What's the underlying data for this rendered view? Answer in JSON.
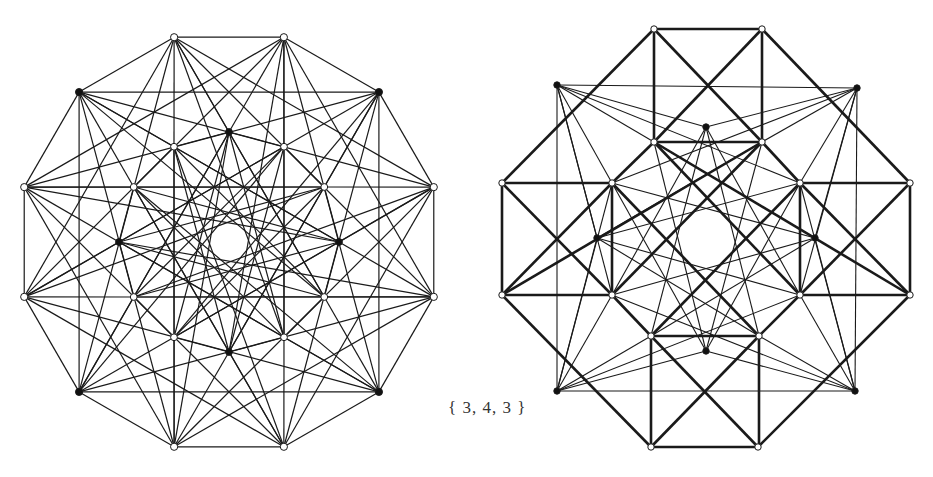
{
  "caption": "{ 3, 4, 3 }",
  "top_clipped_text": "",
  "colors": {
    "line": "#1a1a1a",
    "vertex_fill_white": "#ffffff",
    "vertex_fill_black": "#111111",
    "background": "#ffffff"
  },
  "left_figure": {
    "name": "24-cell projection (dodecagonal)",
    "center": [
      229,
      242
    ],
    "outer_radius": 212,
    "inner_radius": 110,
    "outer_ring": {
      "count": 12,
      "start_angle_deg": 15,
      "black_indices": [
        1,
        4,
        7,
        10
      ]
    },
    "inner_ring": {
      "count": 12,
      "start_angle_deg": 0,
      "black_indices": [
        0,
        3,
        6,
        9
      ]
    },
    "center_hole_radius": 28
  },
  "right_figure": {
    "name": "24-cell projection (octagonal squares)",
    "thick_edges": [
      [
        [
          654,
          29
        ],
        [
          762,
          29
        ]
      ],
      [
        [
          654,
          29
        ],
        [
          654,
          142
        ]
      ],
      [
        [
          762,
          29
        ],
        [
          762,
          142
        ]
      ],
      [
        [
          654,
          142
        ],
        [
          762,
          142
        ]
      ],
      [
        [
          654,
          29
        ],
        [
          762,
          142
        ]
      ],
      [
        [
          762,
          29
        ],
        [
          654,
          142
        ]
      ],
      [
        [
          502,
          183
        ],
        [
          612,
          183
        ]
      ],
      [
        [
          502,
          183
        ],
        [
          502,
          295
        ]
      ],
      [
        [
          612,
          183
        ],
        [
          612,
          295
        ]
      ],
      [
        [
          502,
          295
        ],
        [
          612,
          295
        ]
      ],
      [
        [
          502,
          183
        ],
        [
          612,
          295
        ]
      ],
      [
        [
          612,
          183
        ],
        [
          502,
          295
        ]
      ],
      [
        [
          800,
          183
        ],
        [
          910,
          183
        ]
      ],
      [
        [
          800,
          183
        ],
        [
          800,
          295
        ]
      ],
      [
        [
          910,
          183
        ],
        [
          910,
          295
        ]
      ],
      [
        [
          800,
          295
        ],
        [
          910,
          295
        ]
      ],
      [
        [
          800,
          183
        ],
        [
          910,
          295
        ]
      ],
      [
        [
          910,
          183
        ],
        [
          800,
          295
        ]
      ],
      [
        [
          651,
          336
        ],
        [
          759,
          336
        ]
      ],
      [
        [
          651,
          336
        ],
        [
          651,
          447
        ]
      ],
      [
        [
          759,
          336
        ],
        [
          759,
          447
        ]
      ],
      [
        [
          651,
          447
        ],
        [
          758,
          447
        ]
      ],
      [
        [
          651,
          336
        ],
        [
          758,
          447
        ]
      ],
      [
        [
          759,
          336
        ],
        [
          651,
          447
        ]
      ],
      [
        [
          654,
          29
        ],
        [
          502,
          183
        ]
      ],
      [
        [
          762,
          29
        ],
        [
          910,
          183
        ]
      ],
      [
        [
          502,
          295
        ],
        [
          651,
          447
        ]
      ],
      [
        [
          910,
          295
        ],
        [
          758,
          447
        ]
      ],
      [
        [
          654,
          142
        ],
        [
          612,
          183
        ]
      ],
      [
        [
          762,
          142
        ],
        [
          800,
          183
        ]
      ],
      [
        [
          612,
          295
        ],
        [
          651,
          336
        ]
      ],
      [
        [
          800,
          295
        ],
        [
          759,
          336
        ]
      ],
      [
        [
          654,
          142
        ],
        [
          910,
          295
        ]
      ],
      [
        [
          762,
          142
        ],
        [
          502,
          295
        ]
      ],
      [
        [
          612,
          183
        ],
        [
          759,
          336
        ]
      ],
      [
        [
          800,
          183
        ],
        [
          651,
          336
        ]
      ],
      [
        [
          654,
          142
        ],
        [
          800,
          295
        ]
      ],
      [
        [
          762,
          142
        ],
        [
          612,
          295
        ]
      ]
    ],
    "thin_edges": [
      [
        [
          557,
          85
        ],
        [
          857,
          88
        ]
      ],
      [
        [
          557,
          85
        ],
        [
          557,
          391
        ]
      ],
      [
        [
          857,
          88
        ],
        [
          855,
          391
        ]
      ],
      [
        [
          557,
          391
        ],
        [
          855,
          391
        ]
      ],
      [
        [
          557,
          85
        ],
        [
          706,
          127
        ]
      ],
      [
        [
          557,
          85
        ],
        [
          654,
          142
        ]
      ],
      [
        [
          557,
          85
        ],
        [
          612,
          183
        ]
      ],
      [
        [
          557,
          85
        ],
        [
          800,
          183
        ]
      ],
      [
        [
          557,
          85
        ],
        [
          612,
          295
        ]
      ],
      [
        [
          557,
          85
        ],
        [
          597,
          238
        ]
      ],
      [
        [
          857,
          88
        ],
        [
          706,
          127
        ]
      ],
      [
        [
          857,
          88
        ],
        [
          762,
          142
        ]
      ],
      [
        [
          857,
          88
        ],
        [
          800,
          183
        ]
      ],
      [
        [
          857,
          88
        ],
        [
          612,
          183
        ]
      ],
      [
        [
          857,
          88
        ],
        [
          800,
          295
        ]
      ],
      [
        [
          857,
          88
        ],
        [
          815,
          238
        ]
      ],
      [
        [
          557,
          391
        ],
        [
          706,
          351
        ]
      ],
      [
        [
          557,
          391
        ],
        [
          651,
          336
        ]
      ],
      [
        [
          557,
          391
        ],
        [
          612,
          295
        ]
      ],
      [
        [
          557,
          391
        ],
        [
          800,
          295
        ]
      ],
      [
        [
          557,
          391
        ],
        [
          612,
          183
        ]
      ],
      [
        [
          557,
          391
        ],
        [
          597,
          238
        ]
      ],
      [
        [
          855,
          391
        ],
        [
          706,
          351
        ]
      ],
      [
        [
          855,
          391
        ],
        [
          759,
          336
        ]
      ],
      [
        [
          855,
          391
        ],
        [
          800,
          295
        ]
      ],
      [
        [
          855,
          391
        ],
        [
          612,
          295
        ]
      ],
      [
        [
          855,
          391
        ],
        [
          800,
          183
        ]
      ],
      [
        [
          855,
          391
        ],
        [
          815,
          238
        ]
      ],
      [
        [
          706,
          127
        ],
        [
          612,
          295
        ]
      ],
      [
        [
          706,
          127
        ],
        [
          800,
          295
        ]
      ],
      [
        [
          706,
          127
        ],
        [
          651,
          336
        ]
      ],
      [
        [
          706,
          127
        ],
        [
          759,
          336
        ]
      ],
      [
        [
          706,
          351
        ],
        [
          612,
          183
        ]
      ],
      [
        [
          706,
          351
        ],
        [
          800,
          183
        ]
      ],
      [
        [
          706,
          351
        ],
        [
          654,
          142
        ]
      ],
      [
        [
          706,
          351
        ],
        [
          762,
          142
        ]
      ],
      [
        [
          597,
          238
        ],
        [
          762,
          142
        ]
      ],
      [
        [
          597,
          238
        ],
        [
          759,
          336
        ]
      ],
      [
        [
          597,
          238
        ],
        [
          800,
          183
        ]
      ],
      [
        [
          597,
          238
        ],
        [
          800,
          295
        ]
      ],
      [
        [
          815,
          238
        ],
        [
          654,
          142
        ]
      ],
      [
        [
          815,
          238
        ],
        [
          651,
          336
        ]
      ],
      [
        [
          815,
          238
        ],
        [
          612,
          183
        ]
      ],
      [
        [
          815,
          238
        ],
        [
          612,
          295
        ]
      ]
    ],
    "white_vertices": [
      [
        654,
        29
      ],
      [
        762,
        29
      ],
      [
        654,
        142
      ],
      [
        762,
        142
      ],
      [
        502,
        183
      ],
      [
        612,
        183
      ],
      [
        800,
        183
      ],
      [
        910,
        183
      ],
      [
        502,
        295
      ],
      [
        612,
        295
      ],
      [
        800,
        295
      ],
      [
        910,
        295
      ],
      [
        651,
        336
      ],
      [
        759,
        336
      ],
      [
        651,
        447
      ],
      [
        758,
        447
      ]
    ],
    "black_vertices": [
      [
        557,
        85
      ],
      [
        857,
        88
      ],
      [
        557,
        391
      ],
      [
        855,
        391
      ],
      [
        706,
        127
      ],
      [
        706,
        351
      ],
      [
        597,
        238
      ],
      [
        815,
        238
      ]
    ]
  }
}
